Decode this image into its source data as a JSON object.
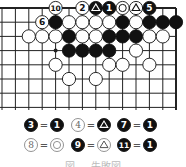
{
  "diagram": {
    "type": "go-board",
    "region": "top edge, right corner",
    "grid": {
      "x0": 2,
      "dx": 13.4,
      "cols": 14,
      "y0": 8,
      "dy": 14.2,
      "rows": 8,
      "right_edge_x": 176,
      "top_edge": true,
      "right_edge": true
    },
    "star_points": [
      [
        4,
        3
      ]
    ],
    "stones": [
      {
        "col": 4,
        "row": 0,
        "color": "white",
        "label": "10"
      },
      {
        "col": 6,
        "row": 0,
        "color": "white",
        "label": "2"
      },
      {
        "col": 7,
        "row": 0,
        "color": "black",
        "mark": "triangle"
      },
      {
        "col": 8,
        "row": 0,
        "color": "black",
        "label": "1"
      },
      {
        "col": 9,
        "row": 0,
        "color": "white",
        "mark": "circle"
      },
      {
        "col": 10,
        "row": 0,
        "color": "white",
        "mark": "triangle"
      },
      {
        "col": 11,
        "row": 0,
        "color": "black",
        "label": "5"
      },
      {
        "col": 3,
        "row": 1,
        "color": "white",
        "label": "6"
      },
      {
        "col": 4,
        "row": 1,
        "color": "black"
      },
      {
        "col": 5,
        "row": 1,
        "color": "white"
      },
      {
        "col": 6,
        "row": 1,
        "color": "white"
      },
      {
        "col": 7,
        "row": 1,
        "color": "white"
      },
      {
        "col": 8,
        "row": 1,
        "color": "white"
      },
      {
        "col": 9,
        "row": 1,
        "color": "black"
      },
      {
        "col": 10,
        "row": 1,
        "color": "white"
      },
      {
        "col": 11,
        "row": 1,
        "color": "black"
      },
      {
        "col": 12,
        "row": 1,
        "color": "black"
      },
      {
        "col": 13,
        "row": 1,
        "color": "black"
      },
      {
        "col": 2,
        "row": 2,
        "color": "white"
      },
      {
        "col": 3,
        "row": 2,
        "color": "white"
      },
      {
        "col": 4,
        "row": 2,
        "color": "white"
      },
      {
        "col": 5,
        "row": 2,
        "color": "black"
      },
      {
        "col": 6,
        "row": 2,
        "color": "white"
      },
      {
        "col": 7,
        "row": 2,
        "color": "white"
      },
      {
        "col": 8,
        "row": 2,
        "color": "black"
      },
      {
        "col": 9,
        "row": 2,
        "color": "black"
      },
      {
        "col": 10,
        "row": 2,
        "color": "black"
      },
      {
        "col": 11,
        "row": 2,
        "color": "white"
      },
      {
        "col": 12,
        "row": 2,
        "color": "white"
      },
      {
        "col": 5,
        "row": 3,
        "color": "black"
      },
      {
        "col": 6,
        "row": 3,
        "color": "black"
      },
      {
        "col": 7,
        "row": 3,
        "color": "black"
      },
      {
        "col": 8,
        "row": 3,
        "color": "black"
      },
      {
        "col": 10,
        "row": 3,
        "color": "white"
      },
      {
        "col": 4,
        "row": 4,
        "color": "white"
      },
      {
        "col": 8,
        "row": 4,
        "color": "white"
      },
      {
        "col": 9,
        "row": 4,
        "color": "white"
      },
      {
        "col": 11,
        "row": 4,
        "color": "white"
      },
      {
        "col": 5,
        "row": 5,
        "color": "white"
      },
      {
        "col": 7,
        "row": 5,
        "color": "white"
      }
    ],
    "legend": [
      [
        {
          "move": "3",
          "move_color": "black",
          "eq": "=",
          "at_color": "black",
          "at_label": "1"
        },
        {
          "move": "4",
          "move_color": "white",
          "eq": "=",
          "at_color": "black",
          "at_mark": "triangle"
        },
        {
          "move": "7",
          "move_color": "black",
          "eq": "=",
          "at_color": "black",
          "at_label": "1"
        }
      ],
      [
        {
          "move": "8",
          "move_color": "white",
          "eq": "=",
          "at_color": "white",
          "at_mark": "circle"
        },
        {
          "move": "9",
          "move_color": "black",
          "eq": "=",
          "at_color": "white",
          "at_mark": "triangle"
        },
        {
          "move": "11",
          "move_color": "black",
          "eq": "=",
          "at_color": "black",
          "at_label": "1"
        }
      ]
    ],
    "caption": "図 ― 失敗図",
    "colors": {
      "line": "#222222",
      "black": "#111111",
      "white": "#ffffff",
      "background": "#ffffff"
    }
  }
}
